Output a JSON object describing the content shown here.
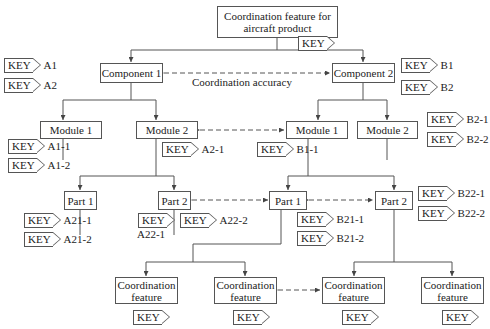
{
  "root": {
    "label": "Coordination feature for aircraft product",
    "key": "KEY"
  },
  "components": [
    {
      "label": "Component 1",
      "keys": [
        {
          "tag": "KEY",
          "id": "A1"
        },
        {
          "tag": "KEY",
          "id": "A2"
        }
      ]
    },
    {
      "label": "Component 2",
      "keys": [
        {
          "tag": "KEY",
          "id": "B1"
        },
        {
          "tag": "KEY",
          "id": "B2"
        }
      ]
    }
  ],
  "coordination_accuracy": "Coordination accuracy",
  "modules": [
    {
      "label": "Module 1",
      "keys": [
        {
          "tag": "KEY",
          "id": "A1-1"
        },
        {
          "tag": "KEY",
          "id": "A1-2"
        }
      ]
    },
    {
      "label": "Module 2",
      "keys": [
        {
          "tag": "KEY",
          "id": "A2-1"
        }
      ]
    },
    {
      "label": "Module 1",
      "keys": [
        {
          "tag": "KEY",
          "id": "B1-1"
        }
      ]
    },
    {
      "label": "Module 2",
      "keys": [
        {
          "tag": "KEY",
          "id": "B2-1"
        },
        {
          "tag": "KEY",
          "id": "B2-2"
        }
      ]
    }
  ],
  "parts": [
    {
      "label": "Part 1",
      "keys": [
        {
          "tag": "KEY",
          "id": "A21-1"
        },
        {
          "tag": "KEY",
          "id": "A21-2"
        }
      ]
    },
    {
      "label": "Part 2",
      "keys": [
        {
          "tag": "KEY",
          "id": "A22-1"
        },
        {
          "tag": "KEY",
          "id": "A22-2"
        }
      ]
    },
    {
      "label": "Part 1",
      "keys": [
        {
          "tag": "KEY",
          "id": "B21-1"
        },
        {
          "tag": "KEY",
          "id": "B21-2"
        }
      ]
    },
    {
      "label": "Part 2",
      "keys": [
        {
          "tag": "KEY",
          "id": "B22-1"
        },
        {
          "tag": "KEY",
          "id": "B22-2"
        }
      ]
    }
  ],
  "features": [
    {
      "line1": "Coordination",
      "line2": "feature",
      "key": "KEY"
    },
    {
      "line1": "Coordination",
      "line2": "feature",
      "key": "KEY"
    },
    {
      "line1": "Coordination",
      "line2": "feature",
      "key": "KEY"
    },
    {
      "line1": "Coordination",
      "line2": "feature",
      "key": "KEY"
    }
  ]
}
